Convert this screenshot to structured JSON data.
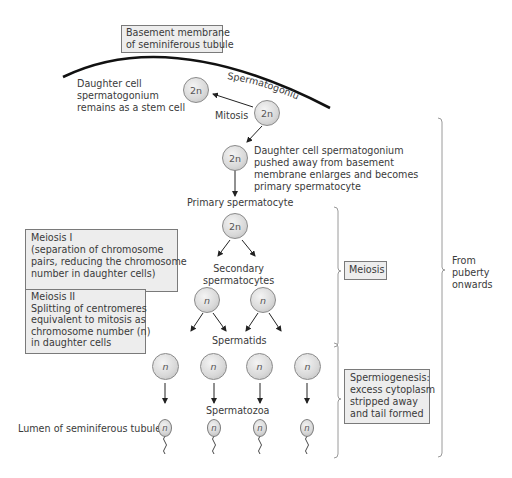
{
  "title_box": {
    "line1": "Basement membrane",
    "line2": "of seminiferous tubule"
  },
  "labels": {
    "spermatogonium": "Spermatogonium",
    "stem_cell": [
      "Daughter cell",
      "spermatogonium",
      "remains as a stem cell"
    ],
    "mitosis": "Mitosis",
    "pushed_away": [
      "Daughter cell spermatogonium",
      "pushed away from basement",
      "membrane enlarges and becomes",
      "primary spermatocyte"
    ],
    "primary_spermatocyte": "Primary spermatocyte",
    "secondary_spermatocytes": [
      "Secondary",
      "spermatocytes"
    ],
    "spermatids": "Spermatids",
    "spermatozoa": "Spermatozoa",
    "lumen": "Lumen of seminiferous tubules",
    "from_puberty": [
      "From",
      "puberty",
      "onwards"
    ]
  },
  "boxes": {
    "meiosis_1": [
      "Meiosis I",
      "(separation of chromosome",
      "pairs, reducing the chromosome",
      "number in daughter cells)"
    ],
    "meiosis_2": [
      "Meiosis II",
      "Splitting of centromeres",
      "equivalent to mitosis as",
      "chromosome number (n)",
      "in daughter cells"
    ],
    "meiosis": "Meiosis",
    "spermiogenesis": [
      "Spermiogenesis:",
      "excess cytoplasm",
      "stripped away",
      "and tail formed"
    ]
  },
  "cells": {
    "stem_cell": "2n",
    "spermatogonium": "2n",
    "daughter_pushed": "2n",
    "primary_spermatocyte": "2n",
    "secondary": [
      "n",
      "n"
    ],
    "spermatids": [
      "n",
      "n",
      "n",
      "n"
    ],
    "spermatozoa": [
      "n",
      "n",
      "n",
      "n"
    ]
  },
  "colors": {
    "box_fill": "#ededed",
    "box_border": "#7a7a7a",
    "text": "#3a3a3a",
    "cell_fill": "#d8d8d8",
    "bracket": "#9a9a9a",
    "membrane": "#111111"
  }
}
